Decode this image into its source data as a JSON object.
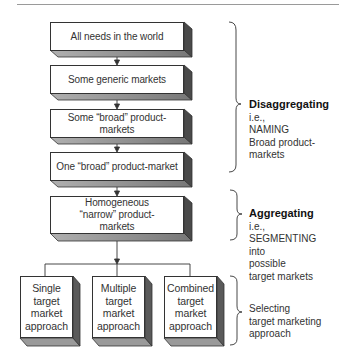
{
  "diagram": {
    "flow_boxes": [
      {
        "label": "All needs in the world"
      },
      {
        "label": "Some generic markets"
      },
      {
        "label": "Some “broad” product-markets"
      },
      {
        "label": "One “broad” product-market"
      },
      {
        "label": "Homogeneous “narrow” product-markets"
      }
    ],
    "approach_boxes": [
      {
        "label": "Single target market approach"
      },
      {
        "label": "Multiple target market approach"
      },
      {
        "label": "Combined target market approach"
      }
    ],
    "annotations": [
      {
        "title": "Disaggregating",
        "lines": [
          "i.e.,",
          "NAMING",
          "Broad product-markets"
        ]
      },
      {
        "title": "Aggregating",
        "lines": [
          "i.e.,",
          "SEGMENTING",
          "into",
          "possible",
          "target markets"
        ]
      },
      {
        "title": "",
        "lines": [
          "Selecting",
          "target marketing",
          "approach"
        ]
      }
    ],
    "colors": {
      "box_face": "#ffffff",
      "box_side": "#5a5a5a",
      "box_bottom": "#8a8a8a",
      "line": "#333333"
    }
  }
}
